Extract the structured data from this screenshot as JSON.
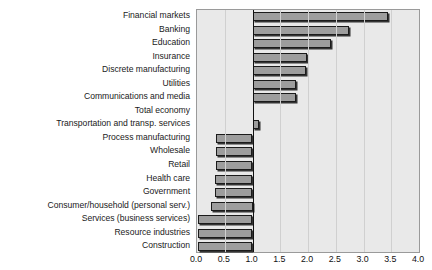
{
  "chart_data": {
    "type": "bar",
    "orientation": "horizontal",
    "title": "",
    "xlabel": "",
    "ylabel": "",
    "xlim": [
      0.0,
      4.0
    ],
    "xticks": [
      "0.0",
      "0.5",
      "1.0",
      "1.5",
      "2.0",
      "2.5",
      "3.0",
      "3.5",
      "4.0"
    ],
    "baseline": 1.0,
    "grid": true,
    "legend": "none",
    "bar_color": "#9d9d9d",
    "bar_edge_color": "#1b1b1b",
    "plot_background": "#e9e9e9",
    "categories": [
      "Financial markets",
      "Banking",
      "Education",
      "Insurance",
      "Discrete manufacturing",
      "Utilities",
      "Communications and media",
      "Total economy",
      "Transportation and transp. services",
      "Process manufacturing",
      "Wholesale",
      "Retail",
      "Health care",
      "Government",
      "Consumer/household (personal serv.)",
      "Services (business services)",
      "Resource industries",
      "Construction"
    ],
    "values": [
      3.45,
      2.73,
      2.42,
      1.99,
      1.97,
      1.78,
      1.78,
      1.0,
      1.12,
      0.35,
      0.35,
      0.35,
      0.33,
      0.32,
      0.25,
      0.02,
      0.02,
      0.02
    ]
  }
}
